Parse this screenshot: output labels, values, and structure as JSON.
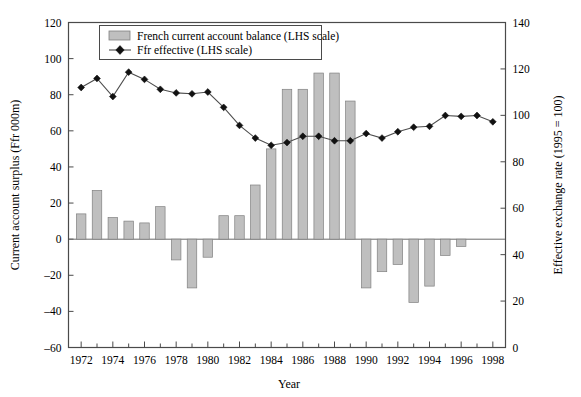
{
  "chart_data": {
    "type": "bar",
    "title": "",
    "xlabel": "Year",
    "ylabel": "Current account surplus (Ffr 000m)",
    "y2label": "Effective exchange rate (1995 = 100)",
    "grid": false,
    "legend_position": "top-left",
    "xlim": [
      1971.2,
      1998.8
    ],
    "ylim": [
      -60,
      120
    ],
    "y2lim": [
      0,
      140
    ],
    "ytick_labels": [
      "120",
      "100",
      "80",
      "60",
      "40",
      "20",
      "0",
      "–20",
      "–40",
      "–60"
    ],
    "ytick_values": [
      120,
      100,
      80,
      60,
      40,
      20,
      0,
      -20,
      -40,
      -60
    ],
    "y2tick_labels": [
      "140",
      "120",
      "100",
      "80",
      "60",
      "40",
      "20",
      "0"
    ],
    "y2tick_values": [
      140,
      120,
      100,
      80,
      60,
      40,
      20,
      0
    ],
    "xtick_labels": [
      "1972",
      "1974",
      "1976",
      "1978",
      "1980",
      "1982",
      "1984",
      "1986",
      "1988",
      "1990",
      "1992",
      "1994",
      "1996",
      "1998"
    ],
    "xtick_values": [
      1972,
      1974,
      1976,
      1978,
      1980,
      1982,
      1984,
      1986,
      1988,
      1990,
      1992,
      1994,
      1996,
      1998
    ],
    "x": [
      1972,
      1973,
      1974,
      1975,
      1976,
      1977,
      1978,
      1979,
      1980,
      1981,
      1982,
      1983,
      1984,
      1985,
      1986,
      1987,
      1988,
      1989,
      1990,
      1991,
      1992,
      1993,
      1994,
      1995,
      1996,
      1997,
      1998
    ],
    "categories": [
      "1972",
      "1973",
      "1974",
      "1975",
      "1976",
      "1977",
      "1978",
      "1979",
      "1980",
      "1981",
      "1982",
      "1983",
      "1984",
      "1985",
      "1986",
      "1987",
      "1988",
      "1989",
      "1990",
      "1991",
      "1992",
      "1993",
      "1994",
      "1995",
      "1996",
      "1997",
      "1998"
    ],
    "series": [
      {
        "name": "French current account balance (LHS scale)",
        "kind": "bar",
        "axis": "left",
        "color": "#bfbfbf",
        "values": [
          14,
          27,
          12,
          10,
          9,
          18,
          -11.5,
          -27,
          -10,
          13,
          13,
          30,
          50,
          83,
          83,
          92,
          92,
          76.5,
          -27,
          -18,
          -14,
          -35,
          -26,
          -9,
          -4,
          0,
          0
        ]
      },
      {
        "name": "Ffr effective (LHS scale)",
        "kind": "line",
        "axis": "left",
        "color": "#111111",
        "values": [
          84,
          89,
          79,
          92.5,
          88.5,
          83,
          81,
          80.5,
          81.5,
          73,
          63,
          56,
          52,
          53.5,
          57,
          57,
          54.5,
          54.5,
          58.5,
          56,
          59.5,
          62,
          62.5,
          68.5,
          68,
          68.5,
          65
        ]
      }
    ],
    "bar_values_by_year": {
      "1972": 14,
      "1973": 27,
      "1974": 12,
      "1975": 10,
      "1976": 9,
      "1977": 18,
      "1978": -11.5,
      "1979": -27,
      "1980": -10,
      "1981": 13,
      "1982": 13,
      "1983": 30,
      "1984": 50,
      "1985": 83,
      "1986": 83,
      "1987": 92,
      "1988": 92,
      "1989": 76.5,
      "1990": -27,
      "1991": -18,
      "1992": -14,
      "1993": -35,
      "1994": -26,
      "1995": -9,
      "1996": -4,
      "1997": 0,
      "1998": 0
    },
    "line_values_by_year": {
      "1972": 84,
      "1973": 89,
      "1974": 79,
      "1975": 92.5,
      "1976": 88.5,
      "1977": 83,
      "1978": 81,
      "1979": 80.5,
      "1980": 81.5,
      "1981": 73,
      "1982": 63,
      "1983": 56,
      "1984": 52,
      "1985": 53.5,
      "1986": 57,
      "1987": 57,
      "1988": 54.5,
      "1989": 54.5,
      "1990": 58.5,
      "1991": 56,
      "1992": 59.5,
      "1993": 62,
      "1994": 62.5,
      "1995": 68.5,
      "1996": 68,
      "1997": 68.5,
      "1998": 65
    }
  },
  "legend": {
    "entries": [
      {
        "label": "French current account balance (LHS scale)",
        "marker": "bar-swatch"
      },
      {
        "label": "Ffr effective (LHS scale)",
        "marker": "line-diamond"
      }
    ]
  },
  "axes": {
    "left_title": "Current account surplus (Ffr 000m)",
    "right_title": "Effective exchange rate (1995 = 100)",
    "bottom_title": "Year"
  }
}
